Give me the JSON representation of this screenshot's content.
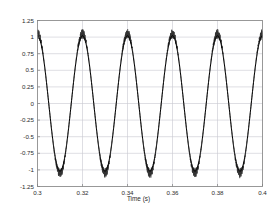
{
  "chart_data": {
    "type": "line",
    "title": "",
    "xlabel": "Time (s)",
    "ylabel": "",
    "xlim": [
      0.3,
      0.4
    ],
    "ylim": [
      -1.25,
      1.25
    ],
    "grid": true,
    "legend_position": "above-plot-left",
    "xticks": [
      0.3,
      0.32,
      0.34,
      0.36,
      0.38,
      0.4
    ],
    "xtick_labels": [
      "0.3",
      "0.32",
      "0.34",
      "0.36",
      "0.38",
      "0.4"
    ],
    "yticks": [
      1.25,
      1,
      0.75,
      0.5,
      0.25,
      0,
      -0.25,
      -0.5,
      -0.75,
      -1,
      -1.25
    ],
    "ytick_labels": [
      "1.25",
      "1",
      "0.75",
      "0.5",
      "0.25",
      "0",
      "-0.25",
      "-0.5",
      "-0.75",
      "-1",
      "-1.25"
    ],
    "series": [
      {
        "name": "Is1",
        "color": "#000000",
        "waveform": "sine",
        "amplitude": 1.02,
        "frequency_hz": 50,
        "phase_deg": 90,
        "offset": 0,
        "noise_amplitude": 0.0,
        "linewidth": 1.0
      },
      {
        "name": "Ip",
        "color": "#333333",
        "waveform": "sine",
        "amplitude": 1.05,
        "frequency_hz": 50,
        "phase_deg": 90,
        "offset": 0,
        "noise_amplitude": 0.055,
        "noise_frequency_hz": 2000,
        "linewidth": 0.7
      }
    ],
    "n_periods": 5,
    "peaks_at": [
      0.3,
      0.32,
      0.34,
      0.36,
      0.38,
      0.4
    ],
    "troughs_at": [
      0.31,
      0.33,
      0.35,
      0.37,
      0.39
    ],
    "peak_value": 1.05,
    "trough_value": -1.05
  },
  "legend": {
    "items": [
      {
        "label": "Is1"
      },
      {
        "label": "Ip"
      }
    ]
  },
  "axis": {
    "xlabel": "Time (s)"
  },
  "colors": {
    "frame": "#7f7f7f",
    "grid": "#c8c8d0",
    "trace": "#000000",
    "text": "#2b2b2b",
    "background": "#ffffff"
  }
}
